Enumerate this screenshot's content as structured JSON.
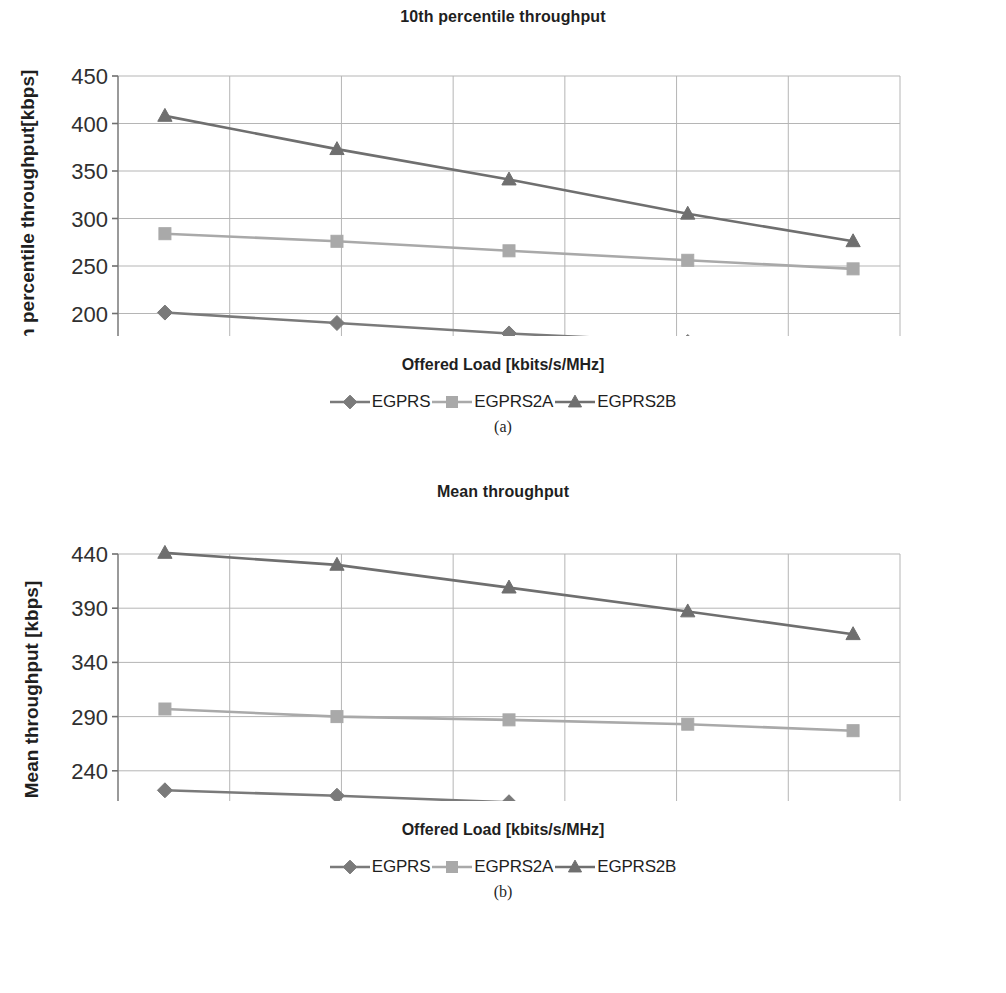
{
  "figures": [
    {
      "id": "a",
      "subcaption": "(a)",
      "chart_data": {
        "type": "line",
        "title": "10th percentile throughput",
        "xlabel": "Offered Load [kbits/s/MHz]",
        "ylabel": "10th percentile throughput[kbps]",
        "xlim": [
          3000,
          10000
        ],
        "ylim": [
          150,
          450
        ],
        "xticks": [
          3000,
          4000,
          5000,
          6000,
          7000,
          8000,
          9000,
          10000
        ],
        "yticks": [
          150,
          200,
          250,
          300,
          350,
          400,
          450
        ],
        "grid": true,
        "legend_position": "below",
        "x": [
          3420,
          4960,
          6500,
          8100,
          9580
        ],
        "series": [
          {
            "name": "EGPRS",
            "marker": "diamond",
            "color": "#7a7a7a",
            "values": [
              201,
              190,
              179,
              170,
              162
            ]
          },
          {
            "name": "EGPRS2A",
            "marker": "square",
            "color": "#a9a9a9",
            "values": [
              284,
              276,
              266,
              256,
              247
            ]
          },
          {
            "name": "EGPRS2B",
            "marker": "triangle",
            "color": "#6f6f6f",
            "values": [
              408,
              373,
              341,
              305,
              276
            ]
          }
        ]
      }
    },
    {
      "id": "b",
      "subcaption": "(b)",
      "chart_data": {
        "type": "line",
        "title": "Mean throughput",
        "xlabel": "Offered Load [kbits/s/MHz]",
        "ylabel": "Mean throughput [kbps]",
        "xlim": [
          3000,
          10000
        ],
        "ylim": [
          190,
          440
        ],
        "xticks": [
          3000,
          4000,
          5000,
          6000,
          7000,
          8000,
          9000,
          10000
        ],
        "yticks": [
          190,
          240,
          290,
          340,
          390,
          440
        ],
        "grid": true,
        "legend_position": "below",
        "x": [
          3420,
          4960,
          6500,
          8100,
          9580
        ],
        "series": [
          {
            "name": "EGPRS",
            "marker": "diamond",
            "color": "#7a7a7a",
            "values": [
              222,
              217,
              211,
              200,
              193
            ]
          },
          {
            "name": "EGPRS2A",
            "marker": "square",
            "color": "#a9a9a9",
            "values": [
              297,
              290,
              287,
              283,
              277
            ]
          },
          {
            "name": "EGPRS2B",
            "marker": "triangle",
            "color": "#6f6f6f",
            "values": [
              441,
              430,
              409,
              387,
              366
            ]
          }
        ]
      }
    }
  ]
}
